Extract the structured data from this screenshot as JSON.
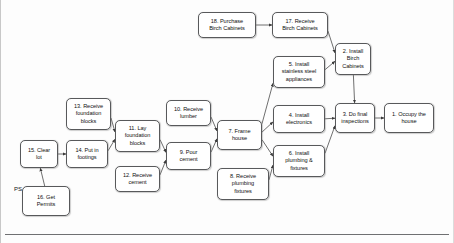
{
  "diagram": {
    "bottom_rule": true,
    "free_labels": [
      {
        "name": "ps-label",
        "text": "PS",
        "x": 13,
        "y": 186
      }
    ],
    "nodes": [
      {
        "id": "n18",
        "name": "node-18-purchase-birch-cabinets",
        "text": "18. Purchase\nBirch Cabinets",
        "x": 197,
        "y": 12,
        "w": 58,
        "h": 26
      },
      {
        "id": "n17",
        "name": "node-17-receive-birch-cabinets",
        "text": "17. Receive\nBirch Cabinets",
        "x": 271,
        "y": 12,
        "w": 56,
        "h": 26
      },
      {
        "id": "n2",
        "name": "node-2-install-birch-cabinets",
        "text": "2. Install\nBirch\nCabinets",
        "x": 334,
        "y": 43,
        "w": 36,
        "h": 32
      },
      {
        "id": "n5",
        "name": "node-5-install-stainless-steel-appliances",
        "text": "5. Install\nstainless steel\nappliances",
        "x": 272,
        "y": 56,
        "w": 52,
        "h": 32
      },
      {
        "id": "n13",
        "name": "node-13-receive-foundation-blocks",
        "text": "13. Receive\nfoundation\nblocks",
        "x": 65,
        "y": 98,
        "w": 45,
        "h": 32
      },
      {
        "id": "n10",
        "name": "node-10-receive-lumber",
        "text": "10. Receive\nlumber",
        "x": 165,
        "y": 100,
        "w": 45,
        "h": 26
      },
      {
        "id": "n4",
        "name": "node-4-install-electronics",
        "text": "4. Install\nelectronics",
        "x": 272,
        "y": 105,
        "w": 52,
        "h": 28
      },
      {
        "id": "n3",
        "name": "node-3-do-final-inspections",
        "text": "3. Do final\ninspections",
        "x": 334,
        "y": 103,
        "w": 40,
        "h": 30
      },
      {
        "id": "n1",
        "name": "node-1-occupy-the-house",
        "text": "1. Occupy the\nhouse",
        "x": 383,
        "y": 103,
        "w": 50,
        "h": 30
      },
      {
        "id": "n11",
        "name": "node-11-lay-foundation-blocks",
        "text": "11. Lay\nfoundation\nblocks",
        "x": 114,
        "y": 120,
        "w": 45,
        "h": 32
      },
      {
        "id": "n7",
        "name": "node-7-frame-house",
        "text": "7. Frame\nhouse",
        "x": 216,
        "y": 120,
        "w": 45,
        "h": 30
      },
      {
        "id": "n15",
        "name": "node-15-clear-lot",
        "text": "15. Clear\nlot",
        "x": 19,
        "y": 140,
        "w": 38,
        "h": 28
      },
      {
        "id": "n14",
        "name": "node-14-put-in-footings",
        "text": "14. Put in\nfootings",
        "x": 65,
        "y": 140,
        "w": 42,
        "h": 28
      },
      {
        "id": "n9",
        "name": "node-9-pour-cement",
        "text": "9. Pour\ncement",
        "x": 165,
        "y": 142,
        "w": 45,
        "h": 28
      },
      {
        "id": "n6",
        "name": "node-6-install-plumbing-and-fixtures",
        "text": "6. Install\nplumbing  &\nfixtures",
        "x": 272,
        "y": 145,
        "w": 52,
        "h": 32
      },
      {
        "id": "n12",
        "name": "node-12-receive-cement",
        "text": "12. Receive\ncement",
        "x": 114,
        "y": 166,
        "w": 45,
        "h": 26
      },
      {
        "id": "n8",
        "name": "node-8-receive-plumbing-fixtures",
        "text": "8. Receive\nplumbing\nfixtures",
        "x": 216,
        "y": 168,
        "w": 52,
        "h": 32
      },
      {
        "id": "n16",
        "name": "node-16-get-permits",
        "text": "16. Get\nPermits",
        "x": 21,
        "y": 186,
        "w": 48,
        "h": 30
      }
    ],
    "edges": [
      {
        "name": "edge-18-to-17",
        "from": "n18",
        "to": "n17"
      },
      {
        "name": "edge-17-to-2",
        "from": "n17",
        "to": "n2"
      },
      {
        "name": "edge-5-to-2",
        "from": "n5",
        "to": "n2"
      },
      {
        "name": "edge-2-to-3",
        "from": "n2",
        "to": "n3"
      },
      {
        "name": "edge-4-to-3",
        "from": "n4",
        "to": "n3"
      },
      {
        "name": "edge-6-to-3",
        "from": "n6",
        "to": "n3"
      },
      {
        "name": "edge-3-to-1",
        "from": "n3",
        "to": "n1"
      },
      {
        "name": "edge-16-to-15",
        "from": "n16",
        "to": "n15"
      },
      {
        "name": "edge-15-to-14",
        "from": "n15",
        "to": "n14"
      },
      {
        "name": "edge-13-to-11",
        "from": "n13",
        "to": "n11"
      },
      {
        "name": "edge-14-to-11",
        "from": "n14",
        "to": "n11"
      },
      {
        "name": "edge-11-to-9",
        "from": "n11",
        "to": "n9"
      },
      {
        "name": "edge-12-to-9",
        "from": "n12",
        "to": "n9"
      },
      {
        "name": "edge-10-to-7",
        "from": "n10",
        "to": "n7"
      },
      {
        "name": "edge-9-to-7",
        "from": "n9",
        "to": "n7"
      },
      {
        "name": "edge-7-to-4",
        "from": "n7",
        "to": "n4"
      },
      {
        "name": "edge-7-to-6",
        "from": "n7",
        "to": "n6"
      },
      {
        "name": "edge-8-to-6",
        "from": "n8",
        "to": "n6"
      },
      {
        "name": "edge-7-to-5",
        "from": "n7",
        "to": "n5"
      }
    ]
  }
}
